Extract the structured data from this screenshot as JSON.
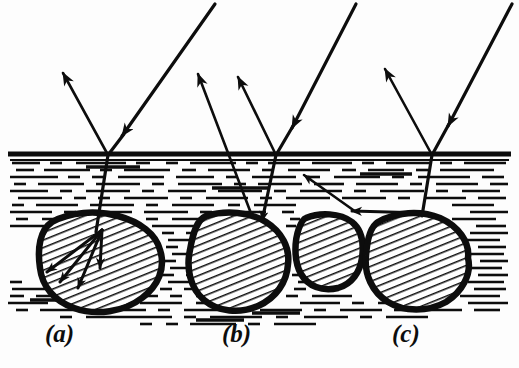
{
  "figure": {
    "kind": "optical-scattering-diagram",
    "background_color": "#fdfdfd",
    "ink_color": "#0d0d0d"
  },
  "watermark": {
    "visible": false,
    "text_top_left": "",
    "text_top_right": ""
  },
  "surface": {
    "name": "water-surface-line",
    "y": 154,
    "x_start": 8,
    "x_end": 511,
    "thickness": 5,
    "color": "#0d0d0d"
  },
  "water": {
    "name": "water-body",
    "top": 160,
    "bottom": 330,
    "texture": "horizontal-dashes",
    "dash_color": "#0d0d0d"
  },
  "panels": [
    {
      "id": "a",
      "label": "(a)",
      "label_x": 55,
      "label_y": 330,
      "caption_note": "ray enters, refracts and scatters inside a single rock",
      "rock_count": 1,
      "internal_scatter_arrows": 4
    },
    {
      "id": "b",
      "label": "(b)",
      "label_x": 233,
      "label_y": 330,
      "caption_note": "ray enters, reflects off rock and returns to the surface",
      "rock_count": 1,
      "internal_scatter_arrows": 0
    },
    {
      "id": "c",
      "label": "(c)",
      "label_x": 403,
      "label_y": 330,
      "caption_note": "ray reflects between two rocks before leaving",
      "rock_count": 2,
      "internal_scatter_arrows": 0
    }
  ],
  "rays": [
    {
      "name": "incident-ray-a",
      "panel": "a",
      "from_x": 214,
      "from_y": 6,
      "to_x": 108,
      "to_y": 155,
      "arrow_at": "middle",
      "direction": "down-left"
    },
    {
      "name": "reflected-ray-a",
      "panel": "a",
      "from_x": 108,
      "from_y": 155,
      "to_x": 62,
      "to_y": 72,
      "arrow_at": "end",
      "direction": "up-left"
    },
    {
      "name": "refracted-ray-a",
      "panel": "a",
      "from_x": 108,
      "from_y": 155,
      "to_x": 97,
      "to_y": 233,
      "arrow_at": "none",
      "direction": "down"
    },
    {
      "name": "incident-ray-b",
      "panel": "b",
      "from_x": 355,
      "from_y": 6,
      "to_x": 276,
      "to_y": 155,
      "arrow_at": "middle",
      "direction": "down-left"
    },
    {
      "name": "reflected-ray-b",
      "panel": "b",
      "from_x": 276,
      "from_y": 155,
      "to_x": 237,
      "to_y": 76,
      "arrow_at": "end",
      "direction": "up-left"
    },
    {
      "name": "refracted-ray-b",
      "panel": "b",
      "from_x": 276,
      "from_y": 155,
      "to_x": 262,
      "to_y": 222,
      "arrow_at": "end",
      "direction": "down-left"
    },
    {
      "name": "exit-ray-b",
      "panel": "b",
      "from_x": 250,
      "from_y": 205,
      "to_x": 196,
      "to_y": 72,
      "arrow_at": "end",
      "direction": "up-left"
    },
    {
      "name": "incident-ray-c",
      "panel": "c",
      "from_x": 510,
      "from_y": 6,
      "to_x": 432,
      "to_y": 155,
      "arrow_at": "middle",
      "direction": "down-left"
    },
    {
      "name": "reflected-ray-c",
      "panel": "c",
      "from_x": 432,
      "from_y": 155,
      "to_x": 384,
      "to_y": 68,
      "arrow_at": "end",
      "direction": "up-left"
    },
    {
      "name": "refracted-ray-c",
      "panel": "c",
      "from_x": 432,
      "from_y": 155,
      "to_x": 423,
      "to_y": 215,
      "arrow_at": "none",
      "direction": "down"
    },
    {
      "name": "inter-rock-ray-c",
      "panel": "c",
      "from_x": 420,
      "from_y": 215,
      "to_x": 355,
      "to_y": 212,
      "arrow_at": "end",
      "direction": "left"
    },
    {
      "name": "upward-ray-c",
      "panel": "c",
      "from_x": 355,
      "from_y": 212,
      "to_x": 303,
      "to_y": 174,
      "arrow_at": "end",
      "direction": "up-left"
    }
  ],
  "rocks": [
    {
      "name": "rock-a",
      "panel": "a",
      "cx": 100,
      "cy": 262,
      "rx": 62,
      "ry": 48,
      "fill": "hatch-diagonal"
    },
    {
      "name": "rock-b",
      "panel": "b",
      "cx": 240,
      "cy": 262,
      "rx": 48,
      "ry": 46,
      "fill": "hatch-diagonal"
    },
    {
      "name": "rock-c1",
      "panel": "c",
      "cx": 330,
      "cy": 250,
      "rx": 33,
      "ry": 37,
      "fill": "hatch-diagonal"
    },
    {
      "name": "rock-c2",
      "panel": "c",
      "cx": 415,
      "cy": 265,
      "rx": 53,
      "ry": 50,
      "fill": "hatch-diagonal"
    }
  ]
}
